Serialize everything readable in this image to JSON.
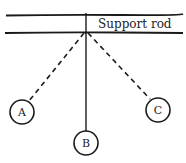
{
  "diagram": {
    "rod_label": "Support rod",
    "pendulums": [
      {
        "label": "A",
        "line_style": "dashed"
      },
      {
        "label": "B",
        "line_style": "solid"
      },
      {
        "label": "C",
        "line_style": "dashed"
      }
    ],
    "colors": {
      "ink": "#1a1a1a",
      "background": "#ffffff"
    }
  }
}
